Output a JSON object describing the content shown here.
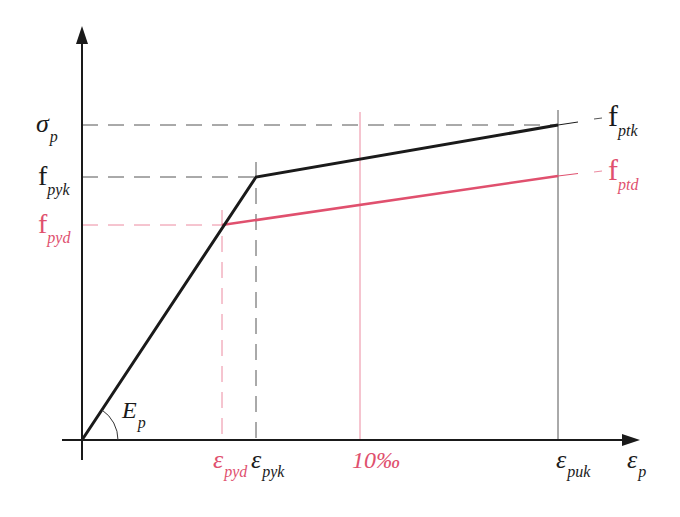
{
  "diagram": {
    "colors": {
      "characteristic": "#1a1a1a",
      "design": "#e0506e",
      "guide": "#444444",
      "guide_design": "#ec8aa0"
    },
    "y_axis": {
      "labels": [
        {
          "main": "σ",
          "sub": "p",
          "color": "characteristic",
          "y": 125
        },
        {
          "main": "f",
          "sub": "pyk",
          "color": "characteristic",
          "y": 177
        },
        {
          "main": "f",
          "sub": "pyd",
          "color": "design",
          "y": 225
        }
      ]
    },
    "x_axis": {
      "labels": [
        {
          "main": "ε",
          "sub": "pyd",
          "color": "design",
          "x": 222
        },
        {
          "main": "ε",
          "sub": "pyk",
          "color": "characteristic",
          "x": 256
        },
        {
          "main": "10‰",
          "sub": "",
          "color": "design",
          "x": 360
        },
        {
          "main": "ε",
          "sub": "puk",
          "color": "characteristic",
          "x": 558
        },
        {
          "main": "ε",
          "sub": "p",
          "color": "characteristic",
          "x": 638
        }
      ]
    },
    "right_labels": [
      {
        "main": "f",
        "sub": "ptk",
        "color": "characteristic"
      },
      {
        "main": "f",
        "sub": "ptd",
        "color": "design"
      }
    ],
    "slope_label": {
      "main": "E",
      "sub": "p"
    },
    "curves": {
      "characteristic": [
        [
          82,
          440
        ],
        [
          256,
          177
        ],
        [
          558,
          125
        ]
      ],
      "design": [
        [
          222,
          225
        ],
        [
          558,
          176
        ]
      ]
    }
  }
}
